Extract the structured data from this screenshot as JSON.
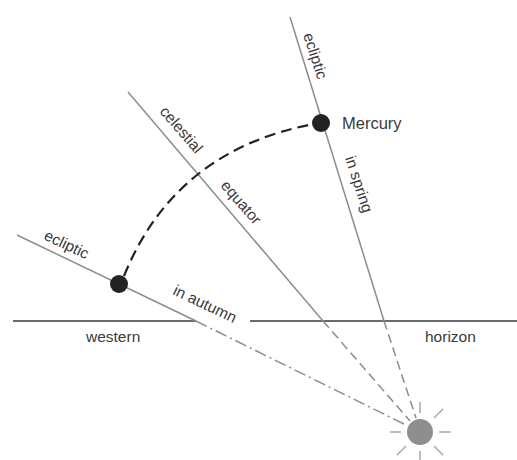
{
  "diagram": {
    "labels": {
      "ecliptic_spring": "ecliptic",
      "in_spring": "in spring",
      "mercury": "Mercury",
      "celestial": "celestial",
      "equator": "equator",
      "ecliptic_autumn": "ecliptic",
      "in_autumn": "in autumn",
      "western": "western",
      "horizon": "horizon"
    },
    "colors": {
      "line": "#8c8c8c",
      "horizon": "#3a3a3a",
      "planet": "#222222",
      "sun": "#8e8e8e",
      "text": "#3a3a3a"
    },
    "elements": {
      "sun": {
        "cx": 420,
        "cy": 432,
        "r": 13
      },
      "mercury_spring": {
        "cx": 321,
        "cy": 123,
        "r": 9
      },
      "mercury_autumn": {
        "cx": 119,
        "cy": 284,
        "r": 9
      },
      "horizon_y": 321
    }
  }
}
